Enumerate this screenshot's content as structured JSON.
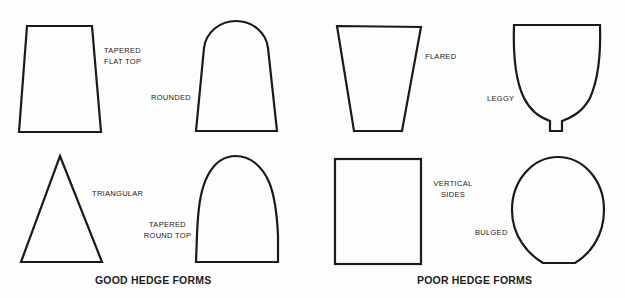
{
  "diagram": {
    "groups": [
      {
        "caption": "GOOD HEDGE FORMS",
        "forms": [
          {
            "id": "tapered-flat-top",
            "label_lines": [
              "TAPERED",
              "FLAT TOP"
            ]
          },
          {
            "id": "rounded",
            "label_lines": [
              "ROUNDED"
            ]
          },
          {
            "id": "triangular",
            "label_lines": [
              "TRIANGULAR"
            ]
          },
          {
            "id": "tapered-round-top",
            "label_lines": [
              "TAPERED",
              "ROUND TOP"
            ]
          }
        ]
      },
      {
        "caption": "POOR HEDGE FORMS",
        "forms": [
          {
            "id": "flared",
            "label_lines": [
              "FLARED"
            ]
          },
          {
            "id": "leggy",
            "label_lines": [
              "LEGGY"
            ]
          },
          {
            "id": "vertical-sides",
            "label_lines": [
              "VERTICAL",
              "SIDES"
            ]
          },
          {
            "id": "bulged",
            "label_lines": [
              "BULGED"
            ]
          }
        ]
      }
    ],
    "colors": {
      "background": "#fdfdfd",
      "stroke": "#1a1a1a",
      "text": "#222222"
    }
  }
}
